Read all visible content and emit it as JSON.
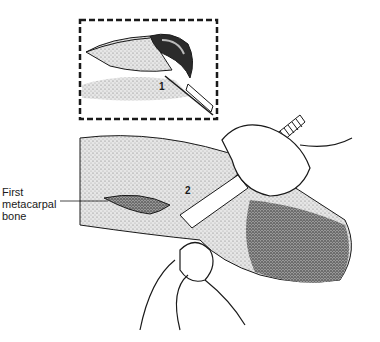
{
  "figure": {
    "type": "surgical-illustration",
    "inset": {
      "step_number": "1",
      "border_style": "dashed"
    },
    "main": {
      "step_number": "2"
    },
    "labels": [
      {
        "id": "first-metacarpal",
        "lines": [
          "First",
          "metacarpal",
          "bone"
        ]
      }
    ]
  },
  "colors": {
    "ink": "#1a1a1a",
    "skin_light": "#d9d9d9",
    "skin_mid": "#a8a8a8",
    "skin_dark": "#4a4a4a",
    "background": "#ffffff"
  }
}
